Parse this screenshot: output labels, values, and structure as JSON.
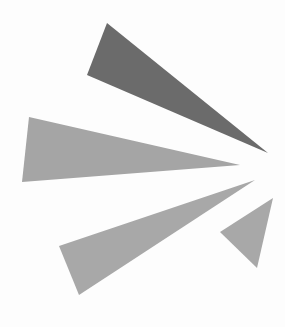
{
  "graphic": {
    "description": "Burst logo of four gray triangles radiating from a focal point at right",
    "background": "#fdfdfd",
    "shapes": [
      {
        "name": "dark-ray",
        "color": "#6b6b6b",
        "points": "107,23 87,75 268,153"
      },
      {
        "name": "wide-ray",
        "color": "#a5a5a5",
        "points": "29,117 22,182 240,165"
      },
      {
        "name": "long-lower-ray",
        "color": "#a8a8a8",
        "points": "59,246 79,295 255,180"
      },
      {
        "name": "small-ray",
        "color": "#a8a8a8",
        "points": "273,198 220,232 257,268"
      }
    ]
  }
}
